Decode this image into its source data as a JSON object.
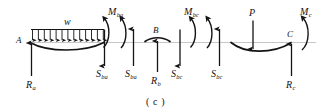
{
  "figure": {
    "caption": "( c )",
    "type": "structural-free-body-diagram",
    "background_color": "#ffffff",
    "ink_color": "#141414",
    "baseline_color": "#b4b4b4"
  },
  "nodes": {
    "a": "A",
    "b": "B",
    "c": "C"
  },
  "loads": {
    "distributed": {
      "symbol": "w",
      "arrow_count": 13
    },
    "point": {
      "symbol": "P"
    }
  },
  "reactions": {
    "ra": {
      "base": "R",
      "sub": "a"
    },
    "rb": {
      "base": "R",
      "sub": "b"
    },
    "rc": {
      "base": "R",
      "sub": "c"
    }
  },
  "shears": {
    "sba_left": {
      "base": "S",
      "sub": "ba"
    },
    "sba_right": {
      "base": "S",
      "sub": "ba"
    },
    "sbc_left": {
      "base": "S",
      "sub": "bc"
    },
    "sbc_right": {
      "base": "S",
      "sub": "bc"
    }
  },
  "moments": {
    "mba": {
      "base": "M",
      "sub": "ba"
    },
    "mbc": {
      "base": "M",
      "sub": "bc"
    },
    "mc": {
      "base": "M",
      "sub": "c"
    }
  }
}
